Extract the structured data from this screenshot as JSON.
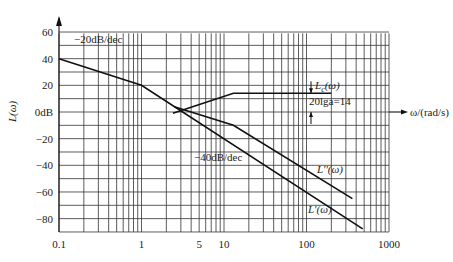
{
  "chart_data": {
    "type": "line",
    "title": "",
    "xlabel": "ω/(rad/s)",
    "ylabel": "L(ω)",
    "xscale": "log",
    "xlim": [
      0.1,
      1000
    ],
    "ylim": [
      -90,
      60
    ],
    "x_ticks": [
      {
        "value": 0.1,
        "label": "0.1"
      },
      {
        "value": 1,
        "label": "1"
      },
      {
        "value": 5,
        "label": "5"
      },
      {
        "value": 10,
        "label": "10"
      },
      {
        "value": 100,
        "label": "100"
      },
      {
        "value": 1000,
        "label": "1000"
      }
    ],
    "y_ticks": [
      {
        "value": 60,
        "label": "60"
      },
      {
        "value": 40,
        "label": "40"
      },
      {
        "value": 20,
        "label": "20"
      },
      {
        "value": 0,
        "label": "0dB"
      },
      {
        "value": -20,
        "label": "-20"
      },
      {
        "value": -40,
        "label": "-40"
      },
      {
        "value": -60,
        "label": "-60"
      },
      {
        "value": -80,
        "label": "-80"
      }
    ],
    "grid": true,
    "series": [
      {
        "name": "L'(ω)",
        "points": [
          [
            0.1,
            40
          ],
          [
            1,
            20
          ],
          [
            480,
            -87.6
          ]
        ]
      },
      {
        "name": "L''(ω)",
        "points": [
          [
            2.5,
            4
          ],
          [
            13,
            -10
          ],
          [
            360,
            -65
          ]
        ]
      },
      {
        "name": "Lc(ω)",
        "points": [
          [
            2.4,
            -1
          ],
          [
            13,
            14
          ],
          [
            200,
            14
          ]
        ]
      }
    ],
    "annotations": [
      {
        "text": "-20dB/dec",
        "near": [
          0.3,
          46
        ]
      },
      {
        "text": "-40dB/dec",
        "near": [
          20,
          -45
        ]
      },
      {
        "text": "20lga=14",
        "near": [
          90,
          7
        ]
      },
      {
        "text": "L''(ω)",
        "near": [
          150,
          -53
        ]
      },
      {
        "text": "L'(ω)",
        "near": [
          140,
          -75
        ]
      },
      {
        "text": "Lc(ω)",
        "near": [
          95,
          20
        ]
      }
    ]
  }
}
